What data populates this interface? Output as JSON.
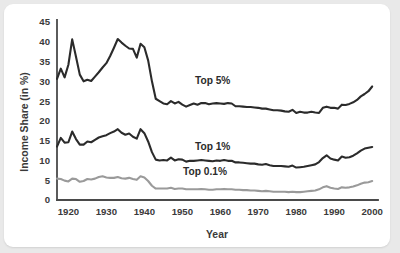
{
  "chart_data": {
    "type": "line",
    "title": "",
    "xlabel": "Year",
    "ylabel": "Income Share (in %)",
    "xlim": [
      1917,
      2001
    ],
    "ylim": [
      0,
      45
    ],
    "xticks": [
      "1920",
      "1930",
      "1940",
      "1950",
      "1960",
      "1970",
      "1980",
      "1990",
      "2000"
    ],
    "xtick_values": [
      1920,
      1930,
      1940,
      1950,
      1960,
      1970,
      1980,
      1990,
      2000
    ],
    "yticks": [
      "0",
      "5",
      "10",
      "15",
      "20",
      "25",
      "30",
      "35",
      "40",
      "45"
    ],
    "ytick_values": [
      0,
      5,
      10,
      15,
      20,
      25,
      30,
      35,
      40,
      45
    ],
    "grid": false,
    "legend_position": "inline-annotations",
    "x": [
      1917,
      1918,
      1919,
      1920,
      1921,
      1922,
      1923,
      1924,
      1925,
      1926,
      1927,
      1928,
      1929,
      1930,
      1931,
      1932,
      1933,
      1934,
      1935,
      1936,
      1937,
      1938,
      1939,
      1940,
      1941,
      1942,
      1943,
      1944,
      1945,
      1946,
      1947,
      1948,
      1949,
      1950,
      1951,
      1952,
      1953,
      1954,
      1955,
      1956,
      1957,
      1958,
      1959,
      1960,
      1961,
      1962,
      1963,
      1964,
      1965,
      1966,
      1967,
      1968,
      1969,
      1970,
      1971,
      1972,
      1973,
      1974,
      1975,
      1976,
      1977,
      1978,
      1979,
      1980,
      1981,
      1982,
      1983,
      1984,
      1985,
      1986,
      1987,
      1988,
      1989,
      1990,
      1991,
      1992,
      1993,
      1994,
      1995,
      1996,
      1997,
      1998,
      1999,
      2000
    ],
    "series": [
      {
        "name": "Top 5%",
        "color": "#2b2b2b",
        "width": 2.1,
        "label_text": "Top 5%",
        "label_x": 1958,
        "label_y": 29.4,
        "values": [
          30.6,
          33.2,
          31.0,
          34.2,
          40.6,
          36.2,
          31.7,
          30.0,
          30.4,
          30.1,
          31.2,
          32.3,
          33.5,
          34.6,
          36.4,
          38.5,
          40.7,
          39.8,
          39.0,
          38.3,
          38.2,
          36.0,
          39.5,
          38.6,
          35.3,
          30.0,
          25.6,
          25.0,
          24.4,
          24.2,
          25.0,
          24.4,
          24.8,
          24.1,
          23.6,
          24.0,
          24.4,
          24.1,
          24.5,
          24.5,
          24.2,
          24.4,
          24.5,
          24.4,
          24.3,
          24.5,
          24.4,
          23.7,
          23.7,
          23.6,
          23.5,
          23.5,
          23.4,
          23.3,
          23.1,
          23.1,
          22.9,
          22.7,
          22.7,
          22.6,
          22.4,
          22.3,
          22.8,
          22.0,
          22.3,
          22.1,
          22.1,
          22.3,
          22.1,
          22.0,
          23.3,
          23.6,
          23.3,
          23.3,
          23.1,
          24.1,
          24.0,
          24.3,
          24.7,
          25.3,
          26.2,
          26.8,
          27.5,
          28.7
        ]
      },
      {
        "name": "Top 1%",
        "color": "#2b2b2b",
        "width": 2.1,
        "label_text": "Top 1%",
        "label_x": 1958,
        "label_y": 12.7,
        "values": [
          13.5,
          15.7,
          14.5,
          14.6,
          17.3,
          15.4,
          14.0,
          14.0,
          14.8,
          14.6,
          15.2,
          15.8,
          16.1,
          16.4,
          16.9,
          17.3,
          17.9,
          17.0,
          16.5,
          16.8,
          16.0,
          15.5,
          17.9,
          16.9,
          14.8,
          12.1,
          10.2,
          10.0,
          10.1,
          10.0,
          10.7,
          10.0,
          10.3,
          10.2,
          9.7,
          9.9,
          9.9,
          10.0,
          10.1,
          10.0,
          9.9,
          9.8,
          10.0,
          9.9,
          10.1,
          9.9,
          9.9,
          9.5,
          9.5,
          9.4,
          9.3,
          9.2,
          9.2,
          9.0,
          8.9,
          9.1,
          8.8,
          8.6,
          8.6,
          8.6,
          8.5,
          8.4,
          8.7,
          8.2,
          8.3,
          8.4,
          8.6,
          8.8,
          9.0,
          9.6,
          10.6,
          11.3,
          10.5,
          10.2,
          10.0,
          11.0,
          10.7,
          10.8,
          11.2,
          11.8,
          12.5,
          13.0,
          13.2,
          13.4
        ]
      },
      {
        "name": "Top 0.1%",
        "color": "#9a9a9a",
        "width": 2.1,
        "label_text": "Top 0.1%",
        "label_x": 1956,
        "label_y": 6.4,
        "values": [
          5.4,
          5.3,
          4.9,
          4.7,
          5.4,
          5.3,
          4.6,
          4.8,
          5.3,
          5.2,
          5.4,
          5.8,
          6.0,
          5.7,
          5.6,
          5.6,
          5.8,
          5.5,
          5.4,
          5.6,
          5.3,
          5.1,
          6.0,
          5.7,
          4.8,
          3.6,
          2.9,
          2.9,
          2.9,
          2.9,
          3.1,
          2.8,
          2.9,
          2.9,
          2.7,
          2.7,
          2.7,
          2.7,
          2.8,
          2.7,
          2.6,
          2.6,
          2.7,
          2.7,
          2.8,
          2.7,
          2.7,
          2.6,
          2.6,
          2.5,
          2.5,
          2.4,
          2.4,
          2.3,
          2.2,
          2.3,
          2.2,
          2.1,
          2.1,
          2.1,
          2.1,
          2.0,
          2.1,
          2.0,
          2.0,
          2.1,
          2.2,
          2.3,
          2.4,
          2.7,
          3.2,
          3.5,
          3.1,
          2.9,
          2.8,
          3.2,
          3.1,
          3.2,
          3.4,
          3.7,
          4.1,
          4.4,
          4.5,
          4.8
        ]
      }
    ]
  },
  "figure": {
    "background": "#ffffff",
    "page_background": "#e9e9e9",
    "axis_color": "#4a4a4a",
    "text_color": "#3a3a3a"
  }
}
